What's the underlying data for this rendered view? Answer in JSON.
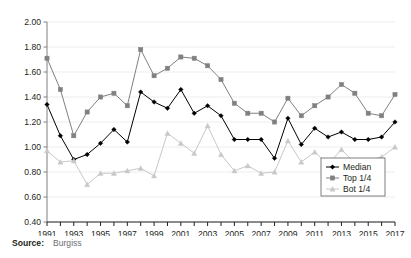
{
  "source": {
    "label": "Source:",
    "value": "Burgiss"
  },
  "chart_data": {
    "type": "line",
    "title": "",
    "xlabel": "",
    "ylabel": "",
    "grid": true,
    "legend_position": "bottom-right",
    "xlim": [
      1991,
      2017
    ],
    "ylim": [
      0.4,
      2.0
    ],
    "ytick_step": 0.2,
    "yticks": [
      "0.40",
      "0.60",
      "0.80",
      "1.00",
      "1.20",
      "1.40",
      "1.60",
      "1.80",
      "2.00"
    ],
    "x": [
      1991,
      1992,
      1993,
      1994,
      1995,
      1996,
      1997,
      1998,
      1999,
      2000,
      2001,
      2002,
      2003,
      2004,
      2005,
      2006,
      2007,
      2008,
      2009,
      2010,
      2011,
      2012,
      2013,
      2014,
      2015,
      2016,
      2017
    ],
    "xtick_labels": [
      "1991",
      "",
      "1993",
      "",
      "1995",
      "",
      "1997",
      "",
      "1999",
      "",
      "2001",
      "",
      "2003",
      "",
      "2005",
      "",
      "2007",
      "",
      "2009",
      "",
      "2011",
      "",
      "2013",
      "",
      "2015",
      "",
      "2017"
    ],
    "xtick_labels_shown": [
      "1991",
      "1993",
      "1995",
      "1997",
      "1999",
      "2001",
      "2003",
      "2005",
      "2007",
      "2009",
      "2011",
      "2013",
      "2015",
      "2017"
    ],
    "series": [
      {
        "name": "Median",
        "color": "#000000",
        "marker": "diamond",
        "values": [
          1.34,
          1.09,
          0.9,
          0.94,
          1.03,
          1.14,
          1.04,
          1.44,
          1.36,
          1.31,
          1.46,
          1.27,
          1.33,
          1.25,
          1.06,
          1.06,
          1.06,
          0.91,
          1.23,
          1.02,
          1.15,
          1.08,
          1.12,
          1.06,
          1.06,
          1.08,
          1.2
        ]
      },
      {
        "name": "Top 1/4",
        "color": "#808080",
        "marker": "square",
        "values": [
          1.71,
          1.46,
          1.09,
          1.28,
          1.4,
          1.43,
          1.33,
          1.78,
          1.57,
          1.63,
          1.72,
          1.71,
          1.65,
          1.54,
          1.35,
          1.27,
          1.27,
          1.2,
          1.39,
          1.25,
          1.33,
          1.4,
          1.5,
          1.43,
          1.27,
          1.25,
          1.42
        ]
      },
      {
        "name": "Bot 1/4",
        "color": "#c8c8c8",
        "marker": "triangle",
        "values": [
          0.97,
          0.88,
          0.89,
          0.7,
          0.79,
          0.79,
          0.81,
          0.83,
          0.77,
          1.11,
          1.03,
          0.95,
          1.17,
          0.94,
          0.81,
          0.85,
          0.79,
          0.8,
          1.05,
          0.88,
          0.96,
          0.86,
          0.98,
          0.87,
          0.89,
          0.92,
          1.0
        ]
      }
    ],
    "legend_entries": [
      "Median",
      "Top 1/4",
      "Bot 1/4"
    ]
  }
}
